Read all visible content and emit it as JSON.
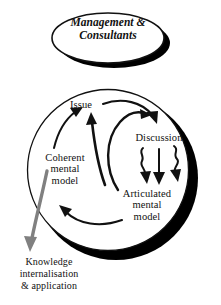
{
  "diagram": {
    "colors": {
      "ink": "#111111",
      "shadow": "#000000",
      "background": "#ffffff",
      "outflow_arrow": "#808080"
    },
    "header": {
      "text": "Management &\nConsultants",
      "shape": "ellipse",
      "shadow": "drop-shadow-crescent"
    },
    "nodes": [
      {
        "id": "issue",
        "label": "Issue"
      },
      {
        "id": "discussion",
        "label": "Discussion"
      },
      {
        "id": "articulated",
        "label": "Articulated\nmental\nmodel"
      },
      {
        "id": "coherent",
        "label": "Coherent\nmental\nmodel"
      }
    ],
    "outflow": {
      "label": "Knowledge\ninternalisation\n& application",
      "arrow_color": "#808080",
      "direction": "down-left"
    },
    "flows": [
      {
        "from": "issue",
        "to": "discussion",
        "style": "curved-arrow"
      },
      {
        "from": "discussion",
        "to": "articulated",
        "style": "wavy-arrow",
        "count": 3
      },
      {
        "from": "articulated",
        "to": "issue",
        "style": "curved-arrow"
      },
      {
        "from": "articulated",
        "to": "coherent",
        "style": "curved-arrow"
      },
      {
        "from": "coherent",
        "to": "issue",
        "style": "curved-arrow"
      },
      {
        "from": "coherent",
        "to": "knowledge",
        "style": "gray-arrow"
      }
    ]
  }
}
